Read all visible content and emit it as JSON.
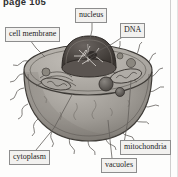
{
  "page": {
    "header_text": "page 105",
    "background_color": "#fdfdfc",
    "rule_color": "#cfcfcf"
  },
  "figure": {
    "name": "animal-cell-diagram",
    "style": "grayscale pencil illustration, cut-away sphere",
    "body_fill": "#9a9691",
    "cut_face_fill": "#b3afa9",
    "nucleus_fill": "#4a4541",
    "outline_color": "#3d3a36"
  },
  "labels": [
    {
      "id": "nucleus",
      "text": "nucleus",
      "box": {
        "left": 75,
        "top": 8
      },
      "leader_to": {
        "x": 85,
        "y": 58
      }
    },
    {
      "id": "dna",
      "text": "DNA",
      "box": {
        "left": 120,
        "top": 23
      },
      "leader_to": {
        "x": 79,
        "y": 60
      }
    },
    {
      "id": "cell-membrane",
      "text": "cell membrane",
      "box": {
        "left": 5,
        "top": 27
      },
      "leader_to": {
        "x": 44,
        "y": 57
      }
    },
    {
      "id": "cytoplasm",
      "text": "cytoplasm",
      "box": {
        "left": 9,
        "top": 150
      },
      "leader_to": {
        "x": 72,
        "y": 93
      }
    },
    {
      "id": "mitochondria",
      "text": "mitochondria",
      "box": {
        "left": 120,
        "top": 140
      },
      "leader_to": {
        "x": 132,
        "y": 78
      }
    },
    {
      "id": "vacuoles",
      "text": "vacuoles",
      "box": {
        "left": 101,
        "top": 158
      },
      "leader_to": {
        "x": 110,
        "y": 120
      }
    }
  ]
}
